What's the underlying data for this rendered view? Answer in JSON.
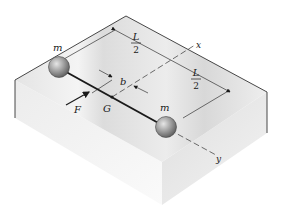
{
  "figure": {
    "labels": {
      "mass_left": "m",
      "mass_right": "m",
      "half_length_top_num": "L",
      "half_length_top_den": "2",
      "half_length_bottom_num": "L",
      "half_length_bottom_den": "2",
      "offset": "b",
      "force": "F",
      "center_of_mass": "G",
      "axis_x": "x",
      "axis_y": "y"
    },
    "colors": {
      "block_top": "#e9e9e9",
      "block_left": "#f1f1f1",
      "block_right": "#e2e2e2",
      "edge": "#333333",
      "rod": "#1a1a1a",
      "sphere": "#9a9a9a",
      "dash": "#333333"
    }
  }
}
